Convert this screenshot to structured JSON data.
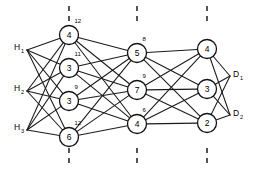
{
  "diagram": {
    "background_color": "#ffffff",
    "line_color": "#1a1a1a",
    "node_fill": "#ffffff",
    "node_stroke": "#111111",
    "layer_markers": [
      {
        "name": "layer-marker-1",
        "x": 69,
        "segments": [
          [
            6,
            24
          ],
          [
            148,
            168
          ]
        ]
      },
      {
        "name": "layer-marker-2",
        "x": 137,
        "segments": [
          [
            6,
            24
          ],
          [
            148,
            168
          ]
        ]
      },
      {
        "name": "layer-marker-3",
        "x": 207,
        "segments": [
          [
            6,
            24
          ],
          [
            148,
            168
          ]
        ]
      }
    ],
    "columns": [
      {
        "name": "column-1",
        "x": 69,
        "nodes": [
          {
            "id": "n1-1",
            "label": "4",
            "weight": "12",
            "cx": 69,
            "cy": 35,
            "r": 9.5
          },
          {
            "id": "n1-2",
            "label": "3",
            "weight": "11",
            "cx": 69,
            "cy": 68,
            "r": 9.5
          },
          {
            "id": "n1-3",
            "label": "3",
            "weight": "9",
            "cx": 69,
            "cy": 101,
            "r": 9.5
          },
          {
            "id": "n1-4",
            "label": "6",
            "weight": "12",
            "cx": 69,
            "cy": 137,
            "r": 9.5
          }
        ]
      },
      {
        "name": "column-2",
        "x": 137,
        "nodes": [
          {
            "id": "n2-1",
            "label": "5",
            "weight": "8",
            "cx": 137,
            "cy": 53,
            "r": 9.5
          },
          {
            "id": "n2-2",
            "label": "7",
            "weight": "9",
            "cx": 137,
            "cy": 90,
            "r": 9.5
          },
          {
            "id": "n2-3",
            "label": "4",
            "weight": "6",
            "cx": 137,
            "cy": 124,
            "r": 9.5
          }
        ]
      },
      {
        "name": "column-3",
        "x": 207,
        "nodes": [
          {
            "id": "n3-1",
            "label": "4",
            "weight": "",
            "cx": 207,
            "cy": 49,
            "r": 9.5
          },
          {
            "id": "n3-2",
            "label": "3",
            "weight": "",
            "cx": 207,
            "cy": 89,
            "r": 9.5
          },
          {
            "id": "n3-3",
            "label": "2",
            "weight": "",
            "cx": 207,
            "cy": 123,
            "r": 9.5
          }
        ]
      }
    ],
    "inputs": [
      {
        "id": "h1",
        "base": "H",
        "sub": "1",
        "x": 17,
        "y": 47,
        "anchor_x": 27,
        "anchor_y": 50
      },
      {
        "id": "h2",
        "base": "H",
        "sub": "2",
        "x": 17,
        "y": 88,
        "anchor_x": 27,
        "anchor_y": 91
      },
      {
        "id": "h3",
        "base": "H",
        "sub": "3",
        "x": 17,
        "y": 127,
        "anchor_x": 27,
        "anchor_y": 130
      }
    ],
    "outputs": [
      {
        "id": "d1",
        "base": "D",
        "sub": "1",
        "x": 236,
        "y": 74,
        "anchor_x": 230,
        "anchor_y": 76
      },
      {
        "id": "d2",
        "base": "D",
        "sub": "2",
        "x": 236,
        "y": 113,
        "anchor_x": 230,
        "anchor_y": 115
      }
    ],
    "edges_input_to_c1": [
      [
        "h1",
        "n1-1"
      ],
      [
        "h1",
        "n1-2"
      ],
      [
        "h1",
        "n1-3"
      ],
      [
        "h1",
        "n1-4"
      ],
      [
        "h2",
        "n1-1"
      ],
      [
        "h2",
        "n1-2"
      ],
      [
        "h2",
        "n1-3"
      ],
      [
        "h2",
        "n1-4"
      ],
      [
        "h3",
        "n1-1"
      ],
      [
        "h3",
        "n1-2"
      ],
      [
        "h3",
        "n1-3"
      ],
      [
        "h3",
        "n1-4"
      ]
    ],
    "edges_c1_to_c2": [
      [
        "n1-1",
        "n2-1"
      ],
      [
        "n1-1",
        "n2-2"
      ],
      [
        "n1-1",
        "n2-3"
      ],
      [
        "n1-2",
        "n2-1"
      ],
      [
        "n1-2",
        "n2-2"
      ],
      [
        "n1-2",
        "n2-3"
      ],
      [
        "n1-3",
        "n2-1"
      ],
      [
        "n1-3",
        "n2-2"
      ],
      [
        "n1-3",
        "n2-3"
      ],
      [
        "n1-4",
        "n2-1"
      ],
      [
        "n1-4",
        "n2-2"
      ],
      [
        "n1-4",
        "n2-3"
      ]
    ],
    "edges_c2_to_c3": [
      [
        "n2-1",
        "n3-1"
      ],
      [
        "n2-1",
        "n3-2"
      ],
      [
        "n2-1",
        "n3-3"
      ],
      [
        "n2-2",
        "n3-1"
      ],
      [
        "n2-2",
        "n3-2"
      ],
      [
        "n2-2",
        "n3-3"
      ],
      [
        "n2-3",
        "n3-1"
      ],
      [
        "n2-3",
        "n3-2"
      ],
      [
        "n2-3",
        "n3-3"
      ]
    ],
    "edges_c3_to_output": [
      [
        "n3-1",
        "d1"
      ],
      [
        "n3-1",
        "d2"
      ],
      [
        "n3-2",
        "d1"
      ],
      [
        "n3-2",
        "d2"
      ],
      [
        "n3-3",
        "d1"
      ],
      [
        "n3-3",
        "d2"
      ]
    ]
  }
}
